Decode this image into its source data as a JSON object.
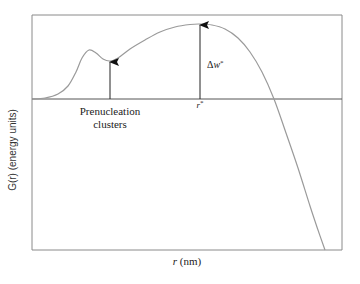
{
  "chart_data": {
    "type": "line",
    "title": "",
    "xlabel": "r (nm)",
    "ylabel": "G(r) (energy units)",
    "grid": false,
    "legend": null,
    "series": [
      {
        "name": "G(r)",
        "color": "#999999",
        "points_px": [
          [
            32,
            99
          ],
          [
            45,
            98
          ],
          [
            58,
            94
          ],
          [
            68,
            86
          ],
          [
            76,
            72
          ],
          [
            82,
            58
          ],
          [
            89,
            50
          ],
          [
            96,
            53
          ],
          [
            103,
            59
          ],
          [
            110,
            61
          ],
          [
            118,
            58
          ],
          [
            130,
            49
          ],
          [
            145,
            40
          ],
          [
            160,
            32
          ],
          [
            175,
            27
          ],
          [
            190,
            24.5
          ],
          [
            200,
            24
          ],
          [
            212,
            25
          ],
          [
            225,
            29
          ],
          [
            238,
            38
          ],
          [
            250,
            52
          ],
          [
            262,
            72
          ],
          [
            274,
            99
          ],
          [
            286,
            133
          ],
          [
            298,
            168
          ],
          [
            310,
            206
          ],
          [
            318,
            230
          ],
          [
            325,
            250
          ]
        ]
      }
    ],
    "annotations": [
      {
        "text": "Prenucleation",
        "x_px": 110,
        "y_px": 112
      },
      {
        "text": "clusters",
        "x_px": 110,
        "y_px": 125
      },
      {
        "text": "r*",
        "x_px": 199,
        "y_px": 106
      },
      {
        "text": "Δw*",
        "x_px": 208,
        "y_px": 65
      }
    ],
    "arrows": [
      {
        "name": "prenucleation-arrow",
        "x_px": 110,
        "from_y_px": 99,
        "to_y_px": 61
      },
      {
        "name": "delta-w-arrow",
        "x_px": 200,
        "from_y_px": 99,
        "to_y_px": 24
      }
    ],
    "zero_line_y_px": 99,
    "frame_px": {
      "left": 32,
      "right": 342,
      "top": 15,
      "bottom": 250
    }
  },
  "labels": {
    "ylabel": "G(r) (energy units)",
    "xlabel_var": "r",
    "xlabel_unit": " (nm)",
    "prenucleation_line1": "Prenucleation",
    "prenucleation_line2": "clusters",
    "rstar_var": "r",
    "rstar_sup": "*",
    "dw_delta": "Δ",
    "dw_var": "w",
    "dw_sup": "*"
  }
}
